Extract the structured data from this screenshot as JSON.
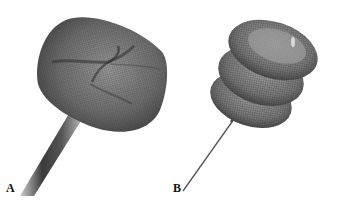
{
  "figure": {
    "panels": [
      {
        "label": "A",
        "subject": "mesh-umbrella-device-on-thick-shaft"
      },
      {
        "label": "B",
        "subject": "mesh-stacked-disc-device-on-thin-wire"
      }
    ],
    "colors": {
      "background": "#ffffff",
      "mesh_dark": "#3a3a3a",
      "mesh_mid": "#777777",
      "mesh_light": "#b5b5b5"
    }
  }
}
